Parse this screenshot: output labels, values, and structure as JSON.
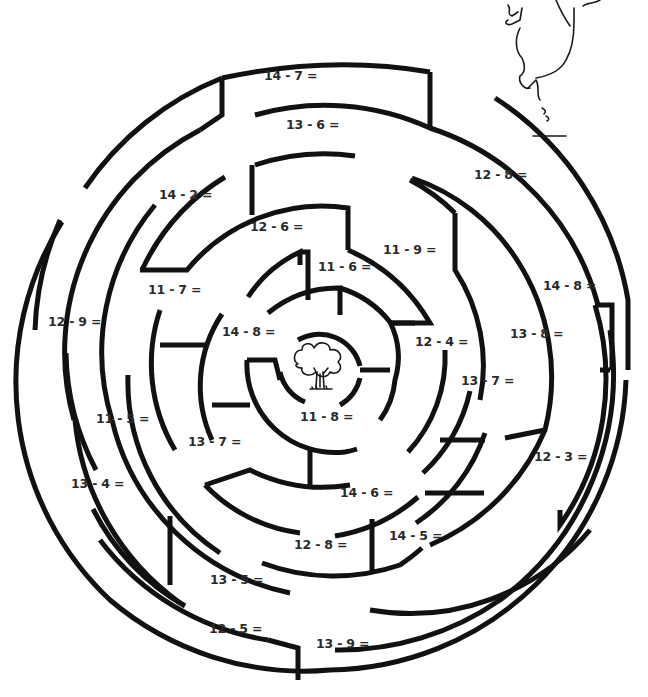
{
  "puzzle": {
    "type": "subtraction maze",
    "goal_icon": "tree-icon",
    "decoration": "pig-character-sketch",
    "problems": [
      {
        "id": "p1",
        "text": "14 - 7 =",
        "x": 264,
        "y": 75
      },
      {
        "id": "p2",
        "text": "13 - 6 =",
        "x": 286,
        "y": 124
      },
      {
        "id": "p3",
        "text": "12 - 8 =",
        "x": 474,
        "y": 174
      },
      {
        "id": "p4",
        "text": "14 - 2 =",
        "x": 159,
        "y": 194
      },
      {
        "id": "p5",
        "text": "12 - 6 =",
        "x": 250,
        "y": 226
      },
      {
        "id": "p6",
        "text": "11 - 9 =",
        "x": 383,
        "y": 249
      },
      {
        "id": "p7",
        "text": "11 - 6 =",
        "x": 318,
        "y": 266
      },
      {
        "id": "p8",
        "text": "14 - 8 =",
        "x": 543,
        "y": 285
      },
      {
        "id": "p9",
        "text": "11 - 7 =",
        "x": 148,
        "y": 289
      },
      {
        "id": "p10",
        "text": "12 - 9 =",
        "x": 48,
        "y": 321
      },
      {
        "id": "p11",
        "text": "14 - 8 =",
        "x": 222,
        "y": 331
      },
      {
        "id": "p12",
        "text": "13 - 8 =",
        "x": 510,
        "y": 333
      },
      {
        "id": "p13",
        "text": "12 - 4 =",
        "x": 415,
        "y": 341
      },
      {
        "id": "p14",
        "text": "13 - 7 =",
        "x": 461,
        "y": 380
      },
      {
        "id": "p15",
        "text": "11 - 5 =",
        "x": 96,
        "y": 418
      },
      {
        "id": "p16",
        "text": "11 - 8 =",
        "x": 300,
        "y": 416
      },
      {
        "id": "p17",
        "text": "13 - 7 =",
        "x": 188,
        "y": 441
      },
      {
        "id": "p18",
        "text": "12 - 3 =",
        "x": 534,
        "y": 456
      },
      {
        "id": "p19",
        "text": "13 - 4 =",
        "x": 71,
        "y": 483
      },
      {
        "id": "p20",
        "text": "14 - 6 =",
        "x": 340,
        "y": 492
      },
      {
        "id": "p21",
        "text": "14 - 5 =",
        "x": 389,
        "y": 535
      },
      {
        "id": "p22",
        "text": "12 - 8 =",
        "x": 294,
        "y": 544
      },
      {
        "id": "p23",
        "text": "13 - 5 =",
        "x": 210,
        "y": 579
      },
      {
        "id": "p24",
        "text": "12 - 5 =",
        "x": 209,
        "y": 628
      },
      {
        "id": "p25",
        "text": "13 - 9 =",
        "x": 316,
        "y": 643
      }
    ]
  },
  "colors": {
    "background": "#ffffff",
    "wall": "#111111",
    "text": "#2a2a2a"
  }
}
